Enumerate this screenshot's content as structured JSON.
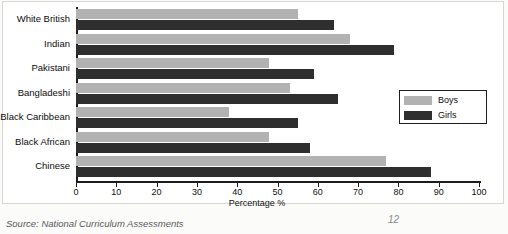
{
  "chart_data": {
    "type": "bar",
    "orientation": "horizontal",
    "title": "",
    "xlabel": "Percentage %",
    "ylabel": "",
    "xlim": [
      0,
      100
    ],
    "xticks": [
      0,
      10,
      20,
      30,
      40,
      50,
      60,
      70,
      80,
      90,
      100
    ],
    "grid": false,
    "legend_position": "right",
    "categories": [
      "White British",
      "Indian",
      "Pakistani",
      "Bangladeshi",
      "Black Caribbean",
      "Black African",
      "Chinese"
    ],
    "series": [
      {
        "name": "Boys",
        "color": "#b2b2b2",
        "values": [
          55,
          68,
          48,
          53,
          38,
          48,
          77
        ]
      },
      {
        "name": "Girls",
        "color": "#2e2e2e",
        "values": [
          64,
          79,
          59,
          65,
          55,
          58,
          88
        ]
      }
    ]
  },
  "legend": {
    "items": [
      {
        "label": "Boys",
        "swatch": "boys"
      },
      {
        "label": "Girls",
        "swatch": "girls"
      }
    ]
  },
  "caption": {
    "source_label": "Source:",
    "source_text": "National Curriculum Assessments",
    "page_mark": "12"
  }
}
